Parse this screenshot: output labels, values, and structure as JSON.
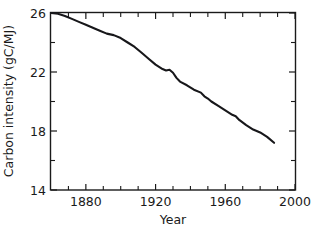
{
  "chart_data": {
    "type": "line",
    "title": "",
    "xlabel": "Year",
    "ylabel": "Carbon intensity (gC/MJ)",
    "xlim": [
      1860,
      2000
    ],
    "ylim": [
      14,
      26
    ],
    "grid": false,
    "legend": null,
    "x_ticks_major": [
      1880,
      1920,
      1960,
      2000
    ],
    "x_ticklabels": [
      "1880",
      "1920",
      "1960",
      "2000"
    ],
    "x_ticks_minor": [
      1870,
      1890,
      1900,
      1910,
      1930,
      1940,
      1950,
      1970,
      1980,
      1990
    ],
    "y_ticks_major": [
      14,
      18,
      22,
      26
    ],
    "y_ticklabels": [
      "14",
      "18",
      "22",
      "26"
    ],
    "y_ticks_minor": [
      16,
      20,
      24
    ],
    "line_color": "#17171a",
    "series": [
      {
        "name": "Carbon intensity",
        "x": [
          1860,
          1864,
          1868,
          1872,
          1876,
          1880,
          1884,
          1888,
          1892,
          1896,
          1900,
          1904,
          1908,
          1912,
          1916,
          1920,
          1924,
          1926,
          1928,
          1930,
          1932,
          1934,
          1938,
          1942,
          1946,
          1948,
          1950,
          1952,
          1956,
          1960,
          1964,
          1966,
          1968,
          1972,
          1976,
          1980,
          1984,
          1988
        ],
        "y": [
          26.0,
          25.95,
          25.8,
          25.6,
          25.4,
          25.2,
          25.0,
          24.8,
          24.6,
          24.5,
          24.3,
          24.0,
          23.7,
          23.3,
          22.9,
          22.5,
          22.2,
          22.1,
          22.15,
          21.95,
          21.6,
          21.35,
          21.1,
          20.8,
          20.6,
          20.35,
          20.2,
          20.0,
          19.7,
          19.4,
          19.1,
          19.0,
          18.75,
          18.4,
          18.1,
          17.9,
          17.6,
          17.2
        ]
      }
    ]
  },
  "axis_titles": {
    "x": "Year",
    "y": "Carbon intensity (gC/MJ)"
  }
}
